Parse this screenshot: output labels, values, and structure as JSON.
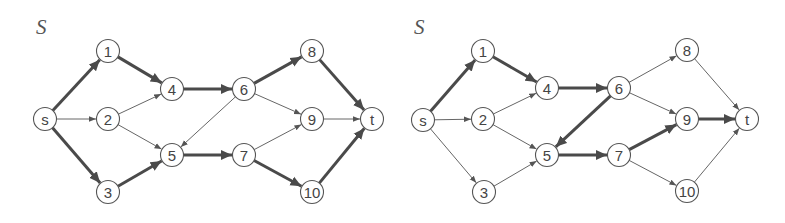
{
  "colors": {
    "background": "#ffffff",
    "thick_edge": "#4a4a4a",
    "thin_edge": "#666666",
    "node_border": "#555555",
    "node_fill": "#ffffff",
    "label": "#444444"
  },
  "node_radius": 11.5,
  "graphs": [
    {
      "id": "left",
      "title": "S",
      "title_pos": [
        36,
        34
      ],
      "nodes": [
        {
          "id": "s",
          "label": "s",
          "x": 45,
          "y": 119
        },
        {
          "id": "1",
          "label": "1",
          "x": 108,
          "y": 51
        },
        {
          "id": "2",
          "label": "2",
          "x": 108,
          "y": 119
        },
        {
          "id": "3",
          "label": "3",
          "x": 108,
          "y": 192
        },
        {
          "id": "4",
          "label": "4",
          "x": 172,
          "y": 89
        },
        {
          "id": "5",
          "label": "5",
          "x": 172,
          "y": 155
        },
        {
          "id": "6",
          "label": "6",
          "x": 244,
          "y": 89
        },
        {
          "id": "7",
          "label": "7",
          "x": 244,
          "y": 155
        },
        {
          "id": "8",
          "label": "8",
          "x": 312,
          "y": 51
        },
        {
          "id": "9",
          "label": "9",
          "x": 312,
          "y": 119
        },
        {
          "id": "10",
          "label": "10",
          "x": 312,
          "y": 192
        },
        {
          "id": "t",
          "label": "t",
          "x": 372,
          "y": 119
        }
      ],
      "edges": [
        {
          "from": "s",
          "to": "1",
          "thick": true
        },
        {
          "from": "s",
          "to": "2",
          "thick": false
        },
        {
          "from": "s",
          "to": "3",
          "thick": true
        },
        {
          "from": "1",
          "to": "4",
          "thick": true
        },
        {
          "from": "2",
          "to": "4",
          "thick": false
        },
        {
          "from": "2",
          "to": "5",
          "thick": false
        },
        {
          "from": "3",
          "to": "5",
          "thick": true
        },
        {
          "from": "4",
          "to": "6",
          "thick": true
        },
        {
          "from": "5",
          "to": "7",
          "thick": true
        },
        {
          "from": "6",
          "to": "5",
          "thick": false
        },
        {
          "from": "6",
          "to": "8",
          "thick": true
        },
        {
          "from": "6",
          "to": "9",
          "thick": false
        },
        {
          "from": "7",
          "to": "9",
          "thick": false
        },
        {
          "from": "7",
          "to": "10",
          "thick": true
        },
        {
          "from": "8",
          "to": "t",
          "thick": true
        },
        {
          "from": "9",
          "to": "t",
          "thick": false
        },
        {
          "from": "10",
          "to": "t",
          "thick": true
        }
      ]
    },
    {
      "id": "right",
      "title": "S",
      "title_pos": [
        414,
        34
      ],
      "nodes": [
        {
          "id": "s",
          "label": "s",
          "x": 423,
          "y": 120
        },
        {
          "id": "1",
          "label": "1",
          "x": 483,
          "y": 51
        },
        {
          "id": "2",
          "label": "2",
          "x": 483,
          "y": 119
        },
        {
          "id": "3",
          "label": "3",
          "x": 484,
          "y": 192
        },
        {
          "id": "4",
          "label": "4",
          "x": 547,
          "y": 88
        },
        {
          "id": "5",
          "label": "5",
          "x": 547,
          "y": 155
        },
        {
          "id": "6",
          "label": "6",
          "x": 619,
          "y": 88
        },
        {
          "id": "7",
          "label": "7",
          "x": 619,
          "y": 155
        },
        {
          "id": "8",
          "label": "8",
          "x": 687,
          "y": 50
        },
        {
          "id": "9",
          "label": "9",
          "x": 687,
          "y": 119
        },
        {
          "id": "10",
          "label": "10",
          "x": 687,
          "y": 191
        },
        {
          "id": "t",
          "label": "t",
          "x": 747,
          "y": 119
        }
      ],
      "edges": [
        {
          "from": "s",
          "to": "1",
          "thick": true
        },
        {
          "from": "s",
          "to": "2",
          "thick": false
        },
        {
          "from": "s",
          "to": "3",
          "thick": false
        },
        {
          "from": "1",
          "to": "4",
          "thick": true
        },
        {
          "from": "2",
          "to": "4",
          "thick": false
        },
        {
          "from": "2",
          "to": "5",
          "thick": false
        },
        {
          "from": "3",
          "to": "5",
          "thick": false
        },
        {
          "from": "4",
          "to": "6",
          "thick": true
        },
        {
          "from": "5",
          "to": "7",
          "thick": true
        },
        {
          "from": "6",
          "to": "5",
          "thick": true
        },
        {
          "from": "6",
          "to": "8",
          "thick": false
        },
        {
          "from": "6",
          "to": "9",
          "thick": false
        },
        {
          "from": "7",
          "to": "9",
          "thick": true
        },
        {
          "from": "7",
          "to": "10",
          "thick": false
        },
        {
          "from": "8",
          "to": "t",
          "thick": false
        },
        {
          "from": "9",
          "to": "t",
          "thick": true
        },
        {
          "from": "10",
          "to": "t",
          "thick": false
        }
      ]
    }
  ]
}
